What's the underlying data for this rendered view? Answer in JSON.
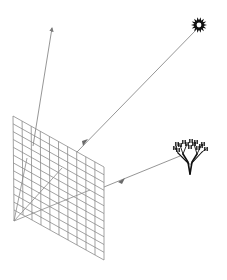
{
  "diagram": {
    "type": "ray-tracing-illustration",
    "colors": {
      "background": "#ffffff",
      "grid_line": "#8a8a8a",
      "ray_line": "#8a8a8a",
      "sun": "#111111",
      "tree": "#111111"
    },
    "elements": {
      "image_plane": {
        "label": "",
        "rows": 12,
        "cols": 10
      },
      "eye_point": {
        "label": ""
      },
      "view_ray_up": {
        "label": ""
      },
      "sun": {
        "label": "",
        "icon": "sun-icon"
      },
      "tree": {
        "label": "",
        "icon": "tree-icon"
      },
      "ray_sun_to_plane": {
        "label": ""
      },
      "ray_tree_to_plane": {
        "label": ""
      }
    }
  }
}
